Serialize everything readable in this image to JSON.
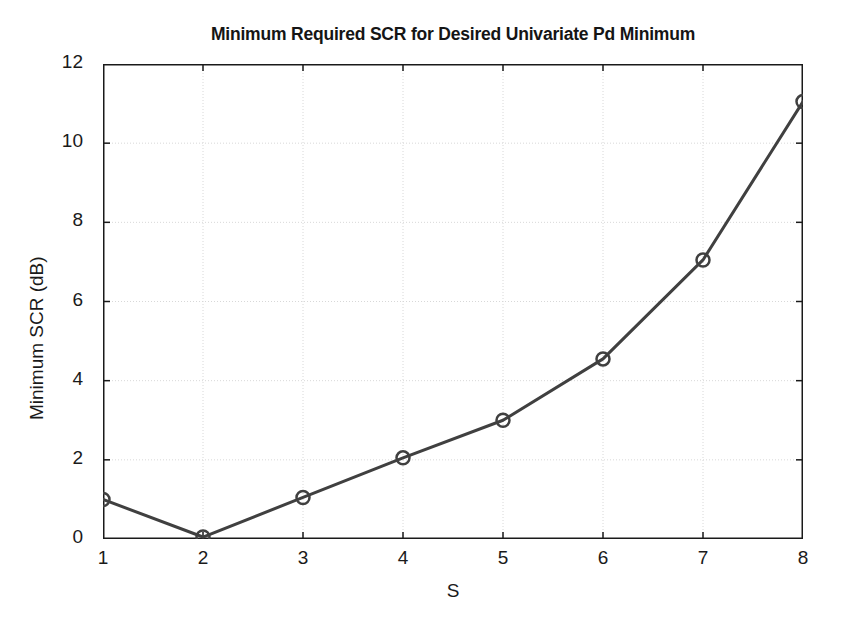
{
  "chart_data": {
    "type": "line",
    "title": "Minimum Required SCR for Desired Univariate Pd Minimum",
    "xlabel": "S",
    "ylabel": "Minimum SCR (dB)",
    "x": [
      1,
      2,
      3,
      4,
      5,
      6,
      7,
      8
    ],
    "values": [
      1.0,
      0.05,
      1.05,
      2.05,
      3.0,
      4.55,
      7.05,
      11.05
    ],
    "series": [
      {
        "name": "Minimum SCR",
        "values": [
          1.0,
          0.05,
          1.05,
          2.05,
          3.0,
          4.55,
          7.05,
          11.05
        ]
      }
    ],
    "xlim": [
      1,
      8
    ],
    "ylim": [
      0,
      12
    ],
    "xticks": [
      1,
      2,
      3,
      4,
      5,
      6,
      7,
      8
    ],
    "yticks": [
      0,
      2,
      4,
      6,
      8,
      10,
      12
    ],
    "xtick_labels": [
      "1",
      "2",
      "3",
      "4",
      "5",
      "6",
      "7",
      "8"
    ],
    "ytick_labels": [
      "0",
      "2",
      "4",
      "6",
      "8",
      "10",
      "12"
    ],
    "grid": true,
    "legend": false,
    "marker": "circle-open",
    "line_color": "#404040",
    "marker_color": "#404040",
    "grid_color": "#d8d8d8",
    "axis_color": "#1a1a1a",
    "background": "#ffffff"
  }
}
